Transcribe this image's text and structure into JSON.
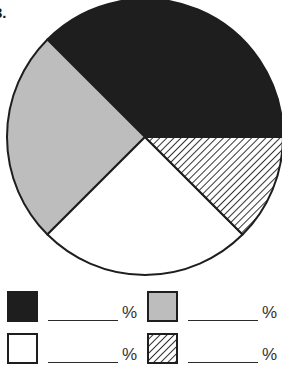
{
  "question": {
    "number": "3."
  },
  "chart_data": {
    "type": "pie",
    "title": "",
    "start_angle_deg": 0,
    "direction": "counterclockwise",
    "slices": [
      {
        "name": "dark",
        "fill": "#1e1e1e",
        "pattern": "solid",
        "value": 37.5
      },
      {
        "name": "gray",
        "fill": "#bdbdbd",
        "pattern": "solid",
        "value": 25
      },
      {
        "name": "white",
        "fill": "#ffffff",
        "pattern": "solid",
        "value": 25
      },
      {
        "name": "hatched",
        "fill": "#ffffff",
        "pattern": "diagonal-hatch",
        "value": 12.5
      }
    ],
    "labels_shown": false,
    "legend_position": "bottom",
    "stroke": "#1e1e1e"
  },
  "legend": {
    "items": [
      {
        "key": "dark",
        "fill": "#1e1e1e",
        "pattern": "solid",
        "blank": "",
        "suffix": "%"
      },
      {
        "key": "gray",
        "fill": "#bdbdbd",
        "pattern": "solid",
        "blank": "",
        "suffix": "%"
      },
      {
        "key": "white",
        "fill": "#ffffff",
        "pattern": "solid",
        "blank": "",
        "suffix": "%"
      },
      {
        "key": "hatched",
        "fill": "#ffffff",
        "pattern": "diagonal-hatch",
        "blank": "",
        "suffix": "%"
      }
    ]
  }
}
